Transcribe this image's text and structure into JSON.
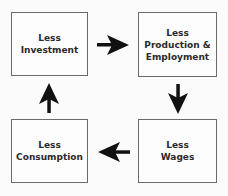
{
  "diagram": {
    "type": "cycle",
    "nodes": [
      {
        "id": "investment",
        "label": "Less\nInvestment"
      },
      {
        "id": "production",
        "label": "Less\nProduction  &\nEmployment"
      },
      {
        "id": "wages",
        "label": "Less\nWages"
      },
      {
        "id": "consumption",
        "label": "Less\nConsumption"
      }
    ],
    "edges": [
      {
        "from": "investment",
        "to": "production",
        "direction": "right"
      },
      {
        "from": "production",
        "to": "wages",
        "direction": "down"
      },
      {
        "from": "wages",
        "to": "consumption",
        "direction": "left"
      },
      {
        "from": "consumption",
        "to": "investment",
        "direction": "up"
      }
    ],
    "colors": {
      "border": "#6a6a6a",
      "arrow": "#111111",
      "text": "#2a2a2a"
    }
  }
}
